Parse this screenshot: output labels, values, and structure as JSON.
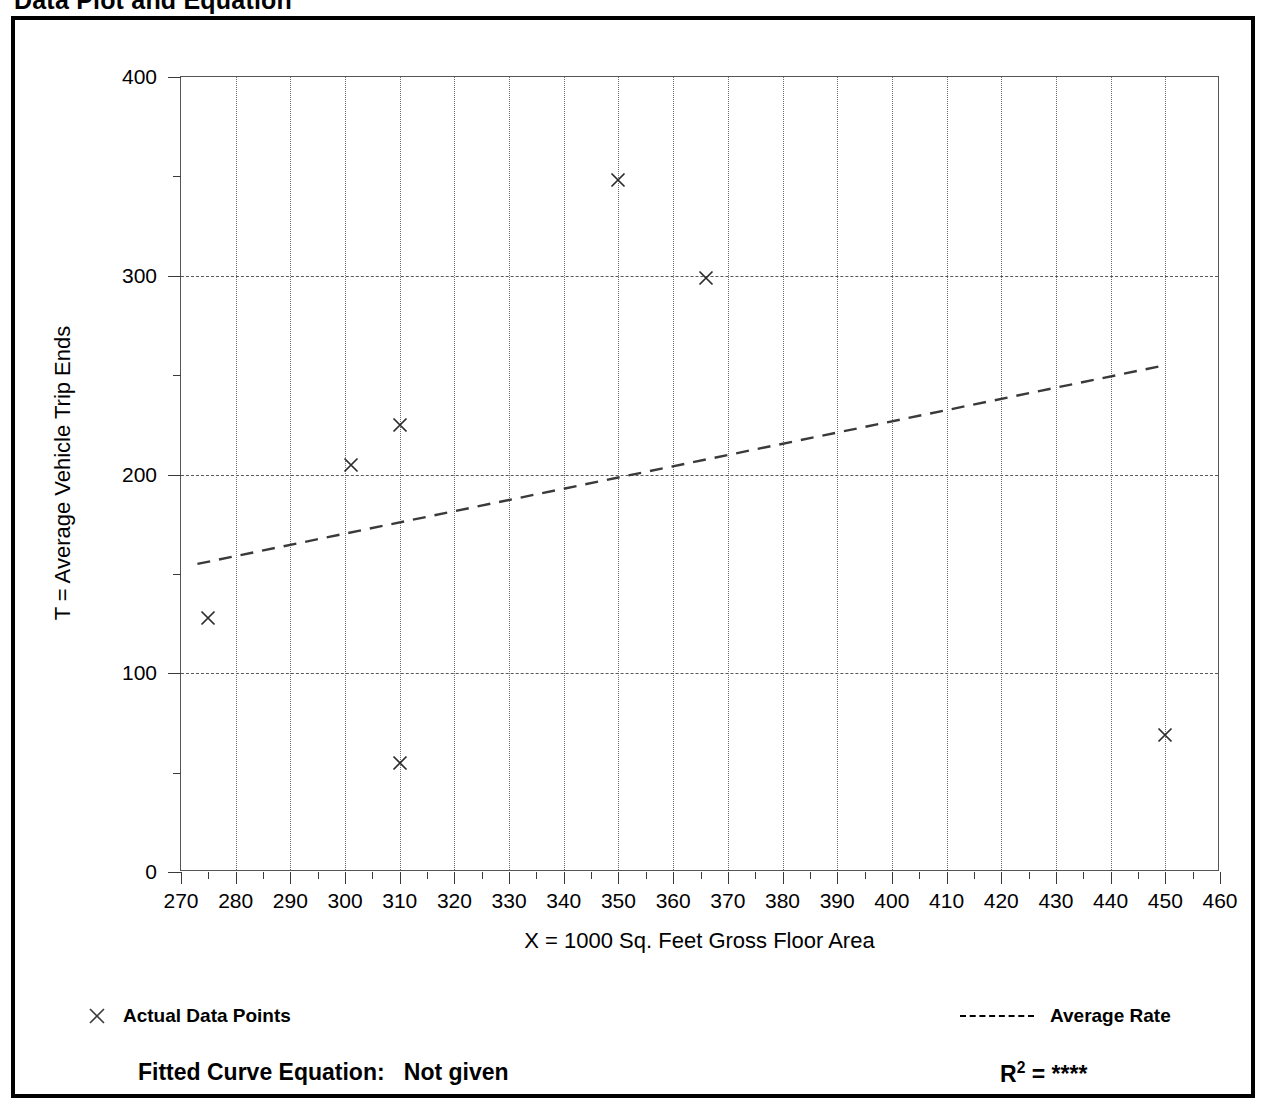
{
  "page": {
    "title": "Data Plot and Equation"
  },
  "chart_data": {
    "type": "scatter",
    "title": "Data Plot and Equation",
    "xlabel": "X = 1000 Sq. Feet Gross Floor Area",
    "ylabel": "T = Average Vehicle Trip Ends",
    "xlim": [
      270,
      460
    ],
    "ylim": [
      0,
      400
    ],
    "xticks": [
      270,
      280,
      290,
      300,
      310,
      320,
      330,
      340,
      350,
      360,
      370,
      380,
      390,
      400,
      410,
      420,
      430,
      440,
      450,
      460
    ],
    "xtick_labels": [
      "270",
      "280",
      "290",
      "300",
      "310",
      "320",
      "330",
      "340",
      "350",
      "360",
      "370",
      "380",
      "390",
      "400",
      "410",
      "420",
      "430",
      "440",
      "450",
      "460"
    ],
    "yticks": [
      0,
      100,
      200,
      300,
      400
    ],
    "ytick_labels": [
      "0",
      "100",
      "200",
      "300",
      "400"
    ],
    "y_minor_ticks": [
      50,
      150,
      250,
      350
    ],
    "x_minor_step": 5,
    "grid": {
      "vertical": "dotted",
      "horizontal": "dashed",
      "horizontal_values": [
        100,
        200,
        300
      ]
    },
    "series": [
      {
        "name": "Actual Data Points",
        "type": "scatter",
        "marker": "x",
        "points": [
          {
            "x": 275,
            "y": 128
          },
          {
            "x": 301,
            "y": 205
          },
          {
            "x": 310,
            "y": 225
          },
          {
            "x": 310,
            "y": 55
          },
          {
            "x": 350,
            "y": 348
          },
          {
            "x": 366,
            "y": 299
          },
          {
            "x": 450,
            "y": 69
          }
        ]
      },
      {
        "name": "Average Rate",
        "type": "line",
        "style": "dashed",
        "endpoints": [
          {
            "x": 273,
            "y": 155
          },
          {
            "x": 450,
            "y": 255
          }
        ]
      }
    ],
    "legend": {
      "position": "below-axes",
      "entries": [
        {
          "label": "Actual Data Points",
          "marker": "x"
        },
        {
          "label": "Average Rate",
          "marker": "dashed-line"
        }
      ]
    },
    "annotations": {
      "fitted_curve_label": "Fitted Curve Equation:",
      "fitted_curve_value": "Not given",
      "r_squared_label": "R",
      "r_squared_exponent": "2",
      "r_squared_equals": "=",
      "r_squared_value": "****"
    }
  },
  "colors": {
    "ink": "#000000",
    "grid": "#5a5a5a",
    "axis": "#3a3a3a"
  }
}
